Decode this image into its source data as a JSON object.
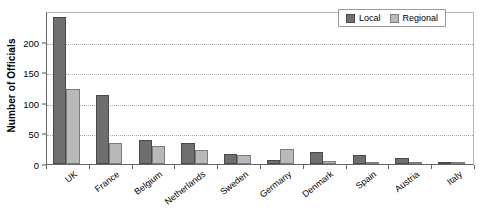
{
  "chart_data": {
    "type": "bar",
    "title": "",
    "xlabel": "",
    "ylabel": "Number of Officials",
    "ylim": [
      0,
      250
    ],
    "yticks": [
      0,
      50,
      100,
      150,
      200
    ],
    "grid": true,
    "legend_position": "top-right",
    "categories": [
      "UK",
      "France",
      "Belgium",
      "Netherlands",
      "Sweden",
      "Germany",
      "Denmark",
      "Spain",
      "Austria",
      "Italy"
    ],
    "series": [
      {
        "name": "Local",
        "color": "#6f6f6f",
        "values": [
          240,
          113,
          40,
          34,
          17,
          7,
          20,
          14,
          10,
          3
        ]
      },
      {
        "name": "Regional",
        "color": "#b9b9b9",
        "values": [
          122,
          35,
          30,
          23,
          14,
          24,
          5,
          1,
          1,
          2
        ]
      }
    ]
  },
  "legend": {
    "entries": [
      {
        "label": "Local"
      },
      {
        "label": "Regional"
      }
    ]
  },
  "axis": {
    "y_title": "Number of Officials",
    "y_tick_labels": [
      "0",
      "50",
      "100",
      "150",
      "200"
    ]
  },
  "colors": {
    "local": "#6f6f6f",
    "regional": "#b9b9b9",
    "grid": "#aaaaaa",
    "axis": "#666666",
    "background": "#ffffff"
  }
}
